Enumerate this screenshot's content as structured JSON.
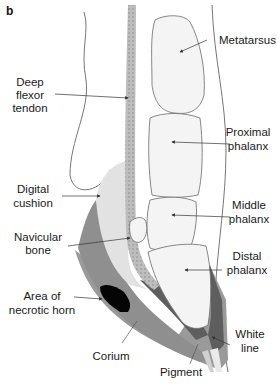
{
  "panel_label": "b",
  "labels": {
    "metatarsus": "Metatarsus",
    "deep_flexor_1": "Deep",
    "deep_flexor_2": "flexor",
    "deep_flexor_3": "tendon",
    "proximal_1": "Proximal",
    "proximal_2": "phalanx",
    "digital_1": "Digital",
    "digital_2": "cushion",
    "middle_1": "Middle",
    "middle_2": "phalanx",
    "navicular_1": "Navicular",
    "navicular_2": "bone",
    "distal_1": "Distal",
    "distal_2": "phalanx",
    "necrotic_1": "Area of",
    "necrotic_2": "necrotic horn",
    "white_1": "White",
    "white_2": "line",
    "corium": "Corium",
    "pigment": "Pigment"
  },
  "colors": {
    "bone_fill": "#f4f4f4",
    "cushion_fill": "#e2e2e2",
    "tendon_fill": "#bdbdbd",
    "horn_fill": "#9a9a9a",
    "corium_fill": "#5e5e5e",
    "necrotic_fill": "#050505",
    "outline": "#6a6a6a"
  }
}
